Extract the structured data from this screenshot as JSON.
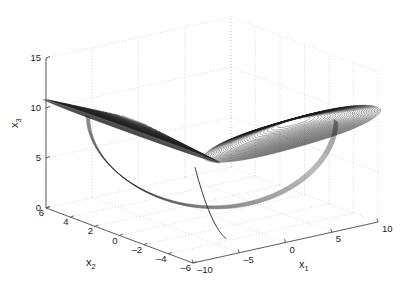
{
  "figure": {
    "type": "matlab-3d-plot",
    "background": "#ffffff",
    "line_color": "#1a1a1a",
    "grid_color": "#b9b9b9",
    "axis_color": "#4d4d4d",
    "text_color": "#1a1a1a"
  },
  "chart_data": {
    "type": "line",
    "title": "",
    "subtitle": "",
    "projection": "3d",
    "xlabel": "x_1",
    "ylabel": "x_2",
    "zlabel": "x_3",
    "xlabel_display": "x₁",
    "ylabel_display": "x₂",
    "zlabel_display": "x₃",
    "xlim": [
      -10,
      10
    ],
    "ylim": [
      -6,
      6
    ],
    "zlim": [
      0,
      15
    ],
    "xticks": [
      -10,
      -5,
      0,
      5,
      10
    ],
    "yticks": [
      6,
      4,
      2,
      0,
      -2,
      -4,
      -6
    ],
    "zticks": [
      0,
      5,
      10,
      15
    ],
    "xticklabels": [
      "-10",
      "-5",
      "0",
      "5",
      "10"
    ],
    "yticklabels": [
      "6",
      "4",
      "2",
      "0",
      "-2",
      "-4",
      "-6"
    ],
    "zticklabels": [
      "0",
      "5",
      "10",
      "15"
    ],
    "grid": true,
    "grid_style": "dotted",
    "legend": null,
    "series": [
      {
        "name": "trajectory",
        "color": "#1a1a1a",
        "linewidth": 0.4,
        "left_wing": {
          "center_x1": -5.2,
          "center_x2": 2.6,
          "center_x3": 9.6,
          "max_radius": 5.4,
          "loops": 34
        },
        "right_wing": {
          "center_x1": 5.2,
          "center_x2": -2.6,
          "center_x3": 9.6,
          "max_radius": 5.4,
          "loops": 34
        },
        "saddle_point": {
          "x1": 0,
          "x2": 0,
          "x3": 0.4
        }
      }
    ]
  },
  "axes": {
    "z": {
      "label": "x₃",
      "ticks": [
        {
          "value": 15,
          "label": "15"
        },
        {
          "value": 10,
          "label": "10"
        },
        {
          "value": 5,
          "label": "5"
        },
        {
          "value": 0,
          "label": "0"
        }
      ]
    },
    "y": {
      "label": "x₂",
      "ticks": [
        {
          "value": 6,
          "label": "6"
        },
        {
          "value": 4,
          "label": "4"
        },
        {
          "value": 2,
          "label": "2"
        },
        {
          "value": 0,
          "label": "0"
        },
        {
          "value": -2,
          "label": "–2"
        },
        {
          "value": -4,
          "label": "–4"
        },
        {
          "value": -6,
          "label": "–6"
        }
      ]
    },
    "x": {
      "label": "x₁",
      "ticks": [
        {
          "value": -10,
          "label": "–10"
        },
        {
          "value": -5,
          "label": "–5"
        },
        {
          "value": 0,
          "label": "0"
        },
        {
          "value": 5,
          "label": "5"
        },
        {
          "value": 10,
          "label": "10"
        }
      ]
    }
  }
}
